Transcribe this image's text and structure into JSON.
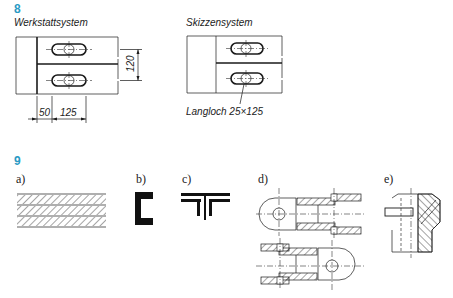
{
  "section8": {
    "number": "8",
    "left_title": "Werkstattsystem",
    "right_title": "Skizzensystem",
    "dimensions": {
      "height": "120",
      "offset": "50",
      "length": "125"
    },
    "callout": "Langloch 25×125"
  },
  "section9": {
    "number": "9",
    "figures": [
      {
        "label": "a)",
        "description": "hatched layered section"
      },
      {
        "label": "b)",
        "description": "channel profile section"
      },
      {
        "label": "c)",
        "description": "T-joint profile section"
      },
      {
        "label": "d)",
        "description": "fork joint sectional views"
      },
      {
        "label": "e)",
        "description": "bushing half section"
      }
    ]
  },
  "colors": {
    "accent": "#2a9ac4",
    "ink": "#1a1a1a"
  }
}
